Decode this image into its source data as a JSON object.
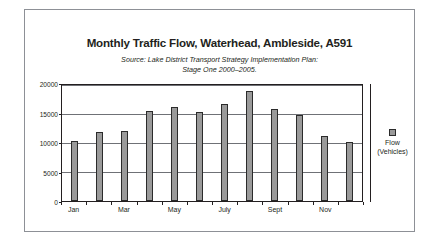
{
  "chart_data": {
    "type": "bar",
    "title": "Monthly Traffic Flow, Waterhead, Ambleside, A591",
    "subtitle_lines": [
      "Source: Lake District Transport Strategy Implementation Plan:",
      "Stage One 2000–2005."
    ],
    "categories": [
      "Jan",
      "Feb",
      "Mar",
      "Apr",
      "May",
      "Jun",
      "July",
      "Aug",
      "Sept",
      "Oct",
      "Nov",
      "Dec"
    ],
    "visible_tick_labels": [
      "Jan",
      "",
      "Mar",
      "",
      "May",
      "",
      "July",
      "",
      "Sept",
      "",
      "Nov",
      ""
    ],
    "values": [
      10400,
      11900,
      12000,
      15500,
      16250,
      15300,
      16800,
      19000,
      15950,
      14800,
      11250,
      10200
    ],
    "series": [
      {
        "name": "Flow (Vehicles)",
        "values": [
          10400,
          11900,
          12000,
          15500,
          16250,
          15300,
          16800,
          19000,
          15950,
          14800,
          11250,
          10200
        ]
      }
    ],
    "xlabel": "",
    "ylabel": "",
    "ylim": [
      0,
      20000
    ],
    "yticks": [
      0,
      5000,
      10000,
      15000,
      20000
    ],
    "ytick_labels": [
      "0",
      "5000",
      "10000",
      "15000",
      "20000"
    ],
    "grid": true,
    "legend_position": "right",
    "legend_entries": [
      {
        "label_lines": [
          "Flow",
          "(Vehicles)"
        ],
        "color": "#9a9a9a"
      }
    ],
    "colors": {
      "bar_fill": "#9a9a9a",
      "bar_stroke": "#2b2b2b",
      "gridline": "#6f7176",
      "axis": "#231f20",
      "frame": "#8d9096",
      "text": "#231f20",
      "background": "#ffffff"
    }
  }
}
